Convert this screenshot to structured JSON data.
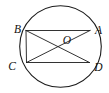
{
  "figure": {
    "background_color": "#ffffff",
    "stroke_color": "#1c1c1c",
    "label_color": "#111111",
    "circle": {
      "cx": 60.5,
      "cy": 46.5,
      "r": 40.8
    },
    "points": {
      "B": {
        "x": 26,
        "y": 30.5
      },
      "A": {
        "x": 90,
        "y": 30.5
      },
      "C": {
        "x": 26.5,
        "y": 62.5
      },
      "D": {
        "x": 89.5,
        "y": 62.5
      },
      "O": {
        "x": 58,
        "y": 46.5
      }
    },
    "segments": [
      {
        "from": "B",
        "to": "A"
      },
      {
        "from": "C",
        "to": "D"
      },
      {
        "from": "B",
        "to": "C"
      },
      {
        "from": "B",
        "to": "D"
      },
      {
        "from": "C",
        "to": "A"
      }
    ],
    "labels": [
      {
        "text": "B",
        "x": 17.5,
        "y": 32.5
      },
      {
        "text": "A",
        "x": 98.5,
        "y": 34
      },
      {
        "text": "C",
        "x": 12,
        "y": 69.5
      },
      {
        "text": "D",
        "x": 98.5,
        "y": 70.5
      },
      {
        "text": "O",
        "x": 67,
        "y": 44
      }
    ]
  }
}
